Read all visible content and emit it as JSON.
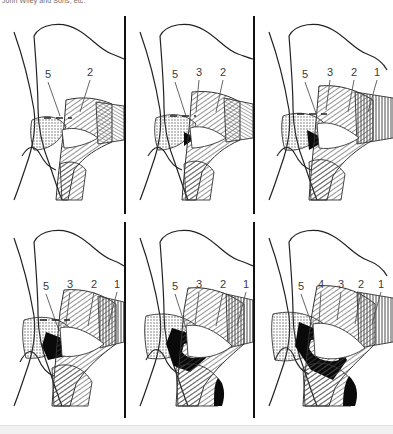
{
  "figure": {
    "credit_text": "John Wiley and Sons, etc.",
    "panel_count": 6,
    "rows": 2,
    "columns": 3,
    "background_color": "#ffffff",
    "ink_color": "#111111",
    "label_color": "#3a3a3a"
  },
  "panels": [
    {
      "id": "panel-1",
      "position": "top-left",
      "labels": [
        {
          "text": "5",
          "x": 48,
          "y": 78,
          "leader_to_x": 62,
          "leader_to_y": 116
        },
        {
          "text": "2",
          "x": 90,
          "y": 76,
          "leader_to_x": 78,
          "leader_to_y": 112
        }
      ]
    },
    {
      "id": "panel-2",
      "position": "top-center",
      "labels": [
        {
          "text": "5",
          "x": 175,
          "y": 78,
          "leader_to_x": 188,
          "leader_to_y": 116
        },
        {
          "text": "3",
          "x": 199,
          "y": 76,
          "leader_to_x": 196,
          "leader_to_y": 110
        },
        {
          "text": "2",
          "x": 223,
          "y": 76,
          "leader_to_x": 216,
          "leader_to_y": 112
        }
      ]
    },
    {
      "id": "panel-3",
      "position": "top-right",
      "labels": [
        {
          "text": "5",
          "x": 305,
          "y": 78,
          "leader_to_x": 318,
          "leader_to_y": 116
        },
        {
          "text": "3",
          "x": 330,
          "y": 76,
          "leader_to_x": 326,
          "leader_to_y": 110
        },
        {
          "text": "2",
          "x": 354,
          "y": 76,
          "leader_to_x": 348,
          "leader_to_y": 112
        },
        {
          "text": "1",
          "x": 377,
          "y": 76,
          "leader_to_x": 368,
          "leader_to_y": 112
        }
      ]
    },
    {
      "id": "panel-4",
      "position": "bottom-left",
      "labels": [
        {
          "text": "5",
          "x": 46,
          "y": 288,
          "leader_to_x": 58,
          "leader_to_y": 326
        },
        {
          "text": "3",
          "x": 70,
          "y": 286,
          "leader_to_x": 68,
          "leader_to_y": 320
        },
        {
          "text": "2",
          "x": 94,
          "y": 286,
          "leader_to_x": 88,
          "leader_to_y": 322
        },
        {
          "text": "1",
          "x": 117,
          "y": 286,
          "leader_to_x": 110,
          "leader_to_y": 322
        }
      ]
    },
    {
      "id": "panel-5",
      "position": "bottom-center",
      "labels": [
        {
          "text": "5",
          "x": 175,
          "y": 288,
          "leader_to_x": 188,
          "leader_to_y": 326
        },
        {
          "text": "3",
          "x": 199,
          "y": 286,
          "leader_to_x": 196,
          "leader_to_y": 320
        },
        {
          "text": "2",
          "x": 223,
          "y": 286,
          "leader_to_x": 216,
          "leader_to_y": 322
        },
        {
          "text": "1",
          "x": 246,
          "y": 286,
          "leader_to_x": 239,
          "leader_to_y": 322
        }
      ]
    },
    {
      "id": "panel-6",
      "position": "bottom-right",
      "labels": [
        {
          "text": "5",
          "x": 302,
          "y": 288,
          "leader_to_x": 314,
          "leader_to_y": 326
        },
        {
          "text": "4",
          "x": 322,
          "y": 286,
          "leader_to_x": 321,
          "leader_to_y": 320
        },
        {
          "text": "3",
          "x": 342,
          "y": 286,
          "leader_to_x": 338,
          "leader_to_y": 318
        },
        {
          "text": "2",
          "x": 362,
          "y": 286,
          "leader_to_x": 356,
          "leader_to_y": 322
        },
        {
          "text": "1",
          "x": 382,
          "y": 286,
          "leader_to_x": 374,
          "leader_to_y": 322
        }
      ]
    }
  ],
  "dividers": {
    "vertical_x_positions": [
      124,
      253
    ],
    "color": "#111111"
  }
}
